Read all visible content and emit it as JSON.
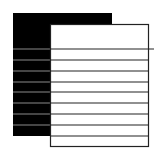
{
  "icon": {
    "name": "documents-stack-icon",
    "colors": {
      "back_page": "#000000",
      "front_page": "#ffffff",
      "stroke": "#222222",
      "back_line": "#888888"
    },
    "back_page": {
      "x": 13,
      "y": 13,
      "w": 99,
      "h": 123
    },
    "front_page": {
      "x": 50,
      "y": 24,
      "w": 98,
      "h": 122
    },
    "lines_y": [
      49,
      60,
      71,
      82,
      92,
      103,
      114,
      125,
      136
    ]
  }
}
